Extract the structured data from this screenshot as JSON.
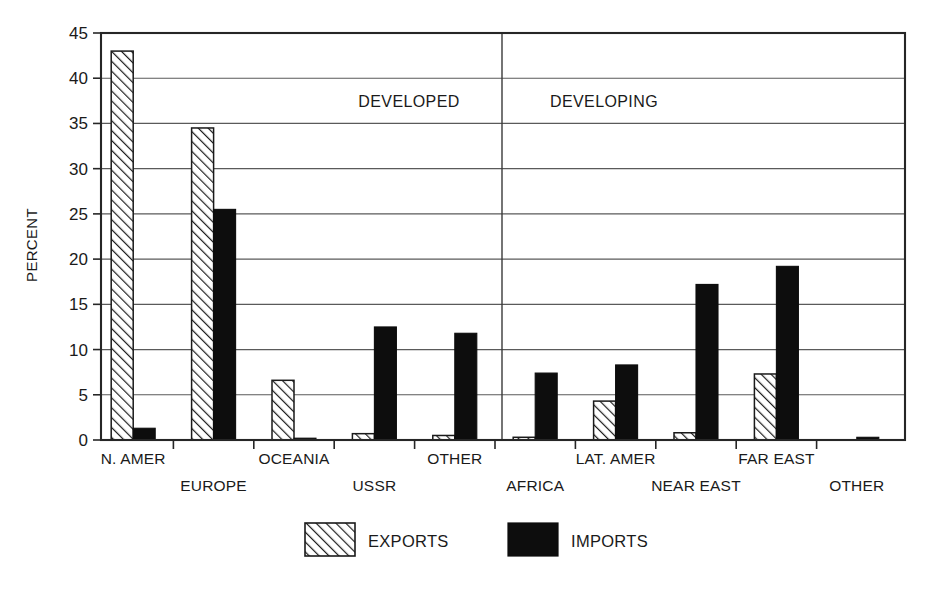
{
  "chart_data": {
    "type": "bar",
    "title": "",
    "subtitle": "",
    "xlabel": "",
    "ylabel": "PERCENT",
    "ylim": [
      0,
      45
    ],
    "ytick_values": [
      0,
      5,
      10,
      15,
      20,
      25,
      30,
      35,
      40,
      45
    ],
    "ytick_labels": [
      "0",
      "5",
      "10",
      "15",
      "20",
      "25",
      "30",
      "35",
      "40",
      "45"
    ],
    "grid": true,
    "grid_axis": "y",
    "legend_position": "bottom",
    "categories": [
      "N. AMER",
      "EUROPE",
      "OCEANIA",
      "USSR",
      "OTHER",
      "AFRICA",
      "LAT. AMER",
      "NEAR EAST",
      "FAR EAST",
      "OTHER"
    ],
    "series": [
      {
        "name": "EXPORTS",
        "pattern": "diagonal-hatch",
        "color": "#ffffff",
        "values": [
          43.0,
          34.5,
          6.6,
          0.7,
          0.5,
          0.3,
          4.3,
          0.8,
          7.3,
          0.0
        ]
      },
      {
        "name": "IMPORTS",
        "pattern": "solid",
        "color": "#0d0d0d",
        "values": [
          1.3,
          25.5,
          0.2,
          12.5,
          11.8,
          7.4,
          8.3,
          17.2,
          19.2,
          0.3
        ]
      }
    ],
    "annotations": [
      {
        "text": "DEVELOPED",
        "x_category_span": [
          0,
          4
        ]
      },
      {
        "text": "DEVELOPING",
        "x_category_span": [
          5,
          9
        ]
      }
    ],
    "group_divider_after_category": 4
  },
  "axis": {
    "y_title": "PERCENT",
    "ticks": [
      "45",
      "40",
      "35",
      "30",
      "25",
      "20",
      "15",
      "10",
      "5",
      "0"
    ]
  },
  "labels": {
    "categories": [
      "N. AMER",
      "EUROPE",
      "OCEANIA",
      "USSR",
      "OTHER",
      "AFRICA",
      "LAT. AMER",
      "NEAR EAST",
      "FAR EAST",
      "OTHER"
    ]
  },
  "annotations": {
    "developed": "DEVELOPED",
    "developing": "DEVELOPING"
  },
  "legend": {
    "exports": "EXPORTS",
    "imports": "IMPORTS"
  }
}
